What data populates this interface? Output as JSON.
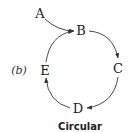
{
  "diagram": {
    "panel_label": "(b)",
    "caption": "Circular",
    "nodes": [
      {
        "id": "A",
        "label": "A"
      },
      {
        "id": "B",
        "label": "B"
      },
      {
        "id": "C",
        "label": "C"
      },
      {
        "id": "D",
        "label": "D"
      },
      {
        "id": "E",
        "label": "E"
      }
    ],
    "edges": [
      {
        "from": "A",
        "to": "B"
      },
      {
        "from": "B",
        "to": "C"
      },
      {
        "from": "C",
        "to": "D"
      },
      {
        "from": "D",
        "to": "E"
      },
      {
        "from": "E",
        "to": "B"
      }
    ],
    "colors": {
      "stroke": "#333333",
      "text": "#222222"
    }
  }
}
